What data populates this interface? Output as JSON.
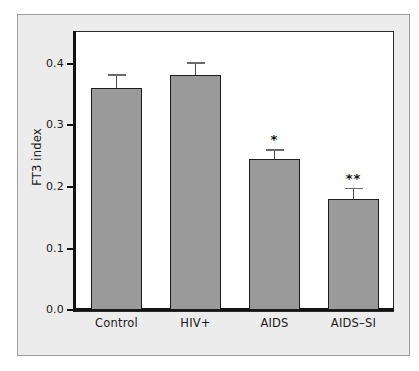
{
  "chart_data": {
    "type": "bar",
    "title": "",
    "xlabel": "",
    "ylabel": "FT3 index",
    "categories": [
      "Control",
      "HIV+",
      "AIDS",
      "AIDS–SI"
    ],
    "values": [
      0.36,
      0.38,
      0.245,
      0.18
    ],
    "errors": [
      0.022,
      0.021,
      0.015,
      0.018
    ],
    "annotations": [
      "",
      "",
      "*",
      "**"
    ],
    "ylim": [
      0.0,
      0.44
    ],
    "yticks": [
      0.0,
      0.1,
      0.2,
      0.3,
      0.4
    ],
    "ytick_labels": [
      "0.0",
      "0.1",
      "0.2",
      "0.3",
      "0.4"
    ],
    "grid": false,
    "legend": null,
    "bar_color": "#9a9a9a",
    "bar_edge_color": "#1d1d1d",
    "axis_color": "#111111",
    "plot_background": "#ffffff",
    "figure_background": "#ececec"
  },
  "axis": {
    "y_title": "FT3 index",
    "ticks": [
      {
        "label": "0.4",
        "value": 0.4
      },
      {
        "label": "0.3",
        "value": 0.3
      },
      {
        "label": "0.2",
        "value": 0.2
      },
      {
        "label": "0.1",
        "value": 0.1
      },
      {
        "label": "0.0",
        "value": 0.0
      }
    ]
  },
  "bars": [
    {
      "label": "Control",
      "value": 0.36,
      "error": 0.022,
      "sig": ""
    },
    {
      "label": "HIV+",
      "value": 0.38,
      "error": 0.021,
      "sig": ""
    },
    {
      "label": "AIDS",
      "value": 0.245,
      "error": 0.015,
      "sig": "*"
    },
    {
      "label": "AIDS–SI",
      "value": 0.18,
      "error": 0.018,
      "sig": "**"
    }
  ]
}
